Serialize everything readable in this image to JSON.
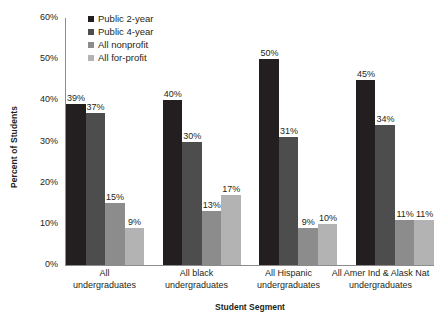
{
  "chart_data": {
    "type": "bar",
    "title": "",
    "xlabel": "Student Segment",
    "ylabel": "Percent of Students",
    "ylim": [
      0,
      60
    ],
    "yticks": [
      "0%",
      "10%",
      "20%",
      "30%",
      "40%",
      "50%",
      "60%"
    ],
    "ytick_values": [
      0,
      10,
      20,
      30,
      40,
      50,
      60
    ],
    "grid": false,
    "legend_position": "top-center",
    "categories": [
      "All\nundergraduates",
      "All black\nundergraduates",
      "All Hispanic\nundergraduates",
      "All Amer Ind & Alask Nat\nundergraduates"
    ],
    "category_lines": [
      [
        "All",
        "undergraduates"
      ],
      [
        "All black",
        "undergraduates"
      ],
      [
        "All Hispanic",
        "undergraduates"
      ],
      [
        "All Amer Ind & Alask Nat",
        "undergraduates"
      ]
    ],
    "series": [
      {
        "name": "Public 2-year",
        "color": "#231f20",
        "values": [
          39,
          40,
          50,
          45
        ],
        "labels": [
          "39%",
          "40%",
          "50%",
          "45%"
        ]
      },
      {
        "name": "Public 4-year",
        "color": "#4d4d4d",
        "values": [
          37,
          30,
          31,
          34
        ],
        "labels": [
          "37%",
          "30%",
          "31%",
          "34%"
        ]
      },
      {
        "name": "All nonprofit",
        "color": "#8c8c8c",
        "values": [
          15,
          13,
          9,
          11
        ],
        "labels": [
          "15%",
          "13%",
          "9%",
          "11%"
        ]
      },
      {
        "name": "All for-profit",
        "color": "#b3b3b3",
        "values": [
          9,
          17,
          10,
          11
        ],
        "labels": [
          "9%",
          "17%",
          "10%",
          "11%"
        ]
      }
    ]
  },
  "colors": {
    "axis": "#8c8c8c",
    "text": "#231f20",
    "background": "#ffffff"
  }
}
